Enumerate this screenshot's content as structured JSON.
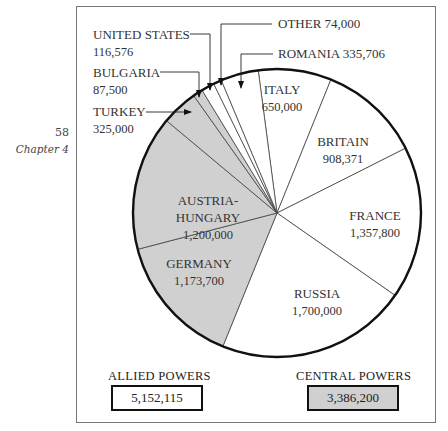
{
  "page": {
    "number": "58",
    "chapter": "Chapter 4"
  },
  "colors": {
    "allied": "#ffffff",
    "central": "#d0d0d0",
    "stroke": "#222222"
  },
  "chart_data": {
    "type": "pie",
    "title": "",
    "start_angle_deg": -7.5,
    "direction": "clockwise",
    "slices": [
      {
        "name": "ITALY",
        "value": 650000,
        "value_label": "650,000",
        "group": "allied"
      },
      {
        "name": "BRITAIN",
        "value": 908371,
        "value_label": "908,371",
        "group": "allied"
      },
      {
        "name": "FRANCE",
        "value": 1357800,
        "value_label": "1,357,800",
        "group": "allied"
      },
      {
        "name": "RUSSIA",
        "value": 1700000,
        "value_label": "1,700,000",
        "group": "allied"
      },
      {
        "name": "GERMANY",
        "value": 1173700,
        "value_label": "1,173,700",
        "group": "central"
      },
      {
        "name": "AUSTRIA-HUNGARY",
        "value": 1200000,
        "value_label": "1,200,000",
        "group": "central"
      },
      {
        "name": "TURKEY",
        "value": 325000,
        "value_label": "325,000",
        "group": "central"
      },
      {
        "name": "BULGARIA",
        "value": 87500,
        "value_label": "87,500",
        "group": "central"
      },
      {
        "name": "UNITED STATES",
        "value": 116576,
        "value_label": "116,576",
        "group": "allied"
      },
      {
        "name": "OTHER",
        "value": 74000,
        "value_label": "74,000",
        "group": "allied"
      },
      {
        "name": "ROMANIA",
        "value": 335706,
        "value_label": "335,706",
        "group": "allied"
      }
    ],
    "totals": [
      {
        "label": "ALLIED POWERS",
        "value": "5,152,115",
        "group": "allied"
      },
      {
        "label": "CENTRAL POWERS",
        "value": "3,386,200",
        "group": "central"
      }
    ]
  }
}
